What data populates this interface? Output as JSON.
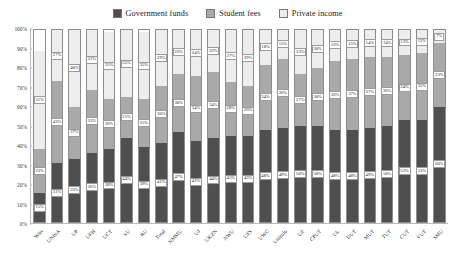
{
  "chart_data": {
    "type": "bar",
    "subtype": "stacked-bar-100",
    "title": "",
    "xlabel": "",
    "ylabel": "",
    "ylim": [
      0,
      100
    ],
    "grid": false,
    "legend_position": "top-center",
    "ytick_labels": [
      "100%",
      "90%",
      "80%",
      "70%",
      "60%",
      "50%",
      "40%",
      "30%",
      "20%",
      "10%",
      "0%"
    ],
    "ytick_values": [
      100,
      90,
      80,
      70,
      60,
      50,
      40,
      30,
      20,
      10,
      0
    ],
    "categories": [
      "Wits",
      "UNISA",
      "UP",
      "UFH",
      "UCT",
      "SU",
      "RU",
      "Total",
      "NMMU",
      "UJ",
      "UKZN",
      "NWU",
      "UFS",
      "UWC",
      "Unizulu",
      "UZ",
      "CPUT",
      "UL",
      "DUT",
      "MUT",
      "TUT",
      "CUT",
      "VUT",
      "SMU"
    ],
    "series": [
      {
        "name": "Government funds",
        "color": "#4f4f4f",
        "values": [
          15,
          31,
          33,
          36,
          38,
          44,
          39,
          41,
          47,
          42,
          44,
          45,
          45,
          48,
          49,
          50,
          50,
          48,
          48,
          49,
          50,
          53,
          53,
          60
        ],
        "labels": [
          "15%",
          "31%",
          "33%",
          "36%",
          "38%",
          "44%",
          "39%",
          "41%",
          "47%",
          "42%",
          "44%",
          "45%",
          "45%",
          "48%",
          "49%",
          "50%",
          "50%",
          "48%",
          "48%",
          "49%",
          "50%",
          "53%",
          "53%",
          "60%"
        ]
      },
      {
        "name": "Student fees",
        "color": "#a9a9a9",
        "values": [
          23,
          43,
          27,
          33,
          26,
          21,
          25,
          30,
          30,
          34,
          34,
          28,
          26,
          34,
          36,
          27,
          30,
          36,
          37,
          37,
          36,
          34,
          35,
          33
        ],
        "labels": [
          "23%",
          "43%",
          "27%",
          "33%",
          "26%",
          "21%",
          "25%",
          "30%",
          "30%",
          "34%",
          "34%",
          "28%",
          "26%",
          "34%",
          "36%",
          "27%",
          "30%",
          "36%",
          "37%",
          "37%",
          "36%",
          "34%",
          "35%",
          "33%"
        ]
      },
      {
        "name": "Private income",
        "color": "#ededed",
        "values": [
          51,
          27,
          40,
          31,
          35,
          35,
          35,
          29,
          23,
          24,
          22,
          27,
          29,
          18,
          15,
          23,
          20,
          16,
          15,
          14,
          14,
          13,
          12,
          7
        ],
        "labels": [
          "51%",
          "27%",
          "40%",
          "31%",
          "35%",
          "35%",
          "35%",
          "29%",
          "23%",
          "24%",
          "22%",
          "27%",
          "29%",
          "18%",
          "15%",
          "23%",
          "20%",
          "16%",
          "15%",
          "14%",
          "14%",
          "13%",
          "12%",
          "7%"
        ]
      }
    ]
  },
  "legend": {
    "items": [
      {
        "label": "Government funds",
        "color": "#4f4f4f"
      },
      {
        "label": "Student fees",
        "color": "#a9a9a9"
      },
      {
        "label": "Private income",
        "color": "#ededed"
      }
    ]
  }
}
